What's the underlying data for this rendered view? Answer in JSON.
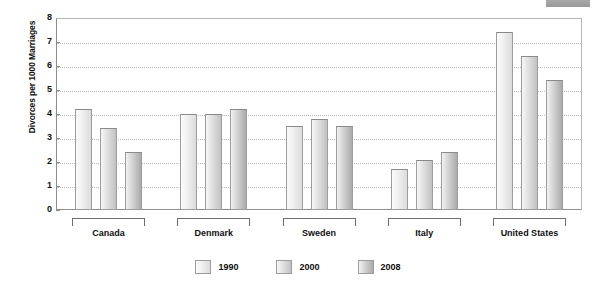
{
  "chart_data": {
    "type": "bar",
    "title": "",
    "xlabel": "",
    "ylabel": "Divorces per 1000 Marriages",
    "ylim": [
      0,
      8
    ],
    "ytick_labels": [
      "0",
      "1",
      "2",
      "3",
      "4",
      "5",
      "6",
      "7",
      "8"
    ],
    "yticks": [
      0,
      1,
      2,
      3,
      4,
      5,
      6,
      7,
      8
    ],
    "grid": true,
    "legend_position": "bottom",
    "categories": [
      "Canada",
      "Denmark",
      "Sweden",
      "Italy",
      "United States"
    ],
    "series": [
      {
        "name": "1990",
        "values": [
          4.2,
          4.0,
          3.5,
          1.7,
          7.4
        ]
      },
      {
        "name": "2000",
        "values": [
          3.4,
          4.0,
          3.8,
          2.1,
          6.4
        ]
      },
      {
        "name": "2008",
        "values": [
          2.4,
          4.2,
          3.5,
          2.4,
          5.4
        ]
      }
    ]
  },
  "legend": {
    "items": [
      {
        "label": "1990",
        "swatch": "series-swatch-1990"
      },
      {
        "label": "2000",
        "swatch": "series-swatch-2000"
      },
      {
        "label": "2008",
        "swatch": "series-swatch-2008"
      }
    ]
  },
  "decor": {
    "top_tab": "top-right-gray-tab"
  }
}
